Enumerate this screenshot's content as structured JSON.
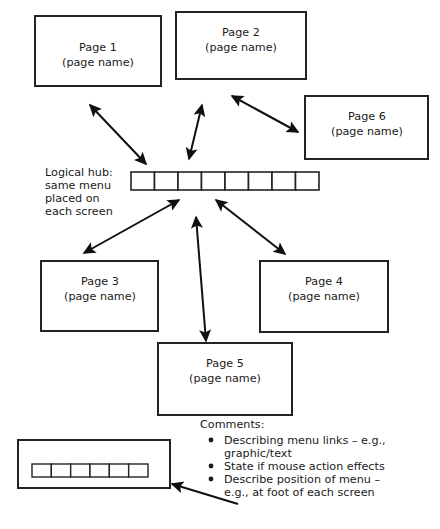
{
  "diagram": {
    "type": "site-map-hub-and-spoke",
    "title_text": null,
    "colors": {
      "background": "#ffffff",
      "stroke": "#232323",
      "arrow": "#101010",
      "text": "#1a1a1a"
    },
    "boxes": [
      {
        "id": "page1",
        "line1": "Page 1",
        "line2": "(page name)"
      },
      {
        "id": "page2",
        "line1": "Page 2",
        "line2": "(page name)"
      },
      {
        "id": "page6",
        "line1": "Page 6",
        "line2": "(page name)"
      },
      {
        "id": "page3",
        "line1": "Page 3",
        "line2": "(page name)"
      },
      {
        "id": "page4",
        "line1": "Page 4",
        "line2": "(page name)"
      },
      {
        "id": "page5",
        "line1": "Page 5",
        "line2": "(page name)"
      }
    ],
    "hub": {
      "label_lines": [
        "Logical hub:",
        "same menu",
        "placed on",
        "each screen"
      ],
      "menu_cell_count": 8
    },
    "screen_example": {
      "menu_cell_count": 6
    },
    "comments": {
      "heading": "Comments:",
      "items": [
        "Describing menu links – e.g., graphic/text",
        "State if mouse action effects",
        "Describe position of menu – e.g., at foot of each screen"
      ],
      "item_lines": [
        [
          "Describing menu links – e.g.,",
          "graphic/text"
        ],
        [
          "State if mouse action effects",
          ""
        ],
        [
          "Describe position of menu –",
          "e.g., at foot of each screen"
        ]
      ]
    },
    "connectors": [
      {
        "id": "hub-page1",
        "from": "hub",
        "to": "page1",
        "style": "double-arrow"
      },
      {
        "id": "hub-page2",
        "from": "hub",
        "to": "page2",
        "style": "double-arrow"
      },
      {
        "id": "page2-page6",
        "from": "page2",
        "to": "page6",
        "style": "double-arrow"
      },
      {
        "id": "hub-page3",
        "from": "hub",
        "to": "page3",
        "style": "double-arrow"
      },
      {
        "id": "hub-page4",
        "from": "hub",
        "to": "page4",
        "style": "double-arrow"
      },
      {
        "id": "hub-page5",
        "from": "hub",
        "to": "page5",
        "style": "double-arrow"
      },
      {
        "id": "comments-screen",
        "from": "comments",
        "to": "screen-example",
        "style": "single-arrow"
      }
    ]
  }
}
